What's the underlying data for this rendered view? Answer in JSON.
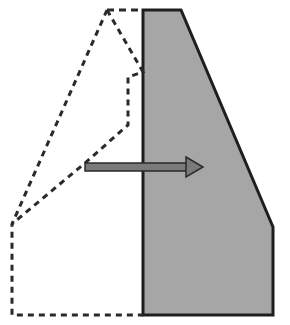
{
  "diagram": {
    "title": "Shape translation diagram",
    "original_shape": {
      "label": "original-outline",
      "style": "dashed",
      "stroke": "#2a2a2a",
      "points": [
        [
          107,
          10
        ],
        [
          143,
          10
        ],
        [
          143,
          72
        ],
        [
          128,
          77
        ],
        [
          128,
          125
        ],
        [
          85,
          163
        ],
        [
          12,
          224
        ],
        [
          12,
          315
        ],
        [
          143,
          315
        ]
      ],
      "outer_edge": [
        [
          107,
          10
        ],
        [
          12,
          224
        ]
      ]
    },
    "moved_shape": {
      "label": "translated-shape",
      "style": "solid",
      "fill": "#a6a6a6",
      "stroke": "#1e1e1e",
      "points": [
        [
          143,
          10
        ],
        [
          181,
          10
        ],
        [
          273,
          227
        ],
        [
          273,
          315
        ],
        [
          143,
          315
        ]
      ]
    },
    "arrow": {
      "label": "translation-arrow",
      "fill": "#7a7a7a",
      "stroke": "#2a2a2a",
      "from": [
        85,
        167
      ],
      "to": [
        203,
        167
      ]
    }
  }
}
